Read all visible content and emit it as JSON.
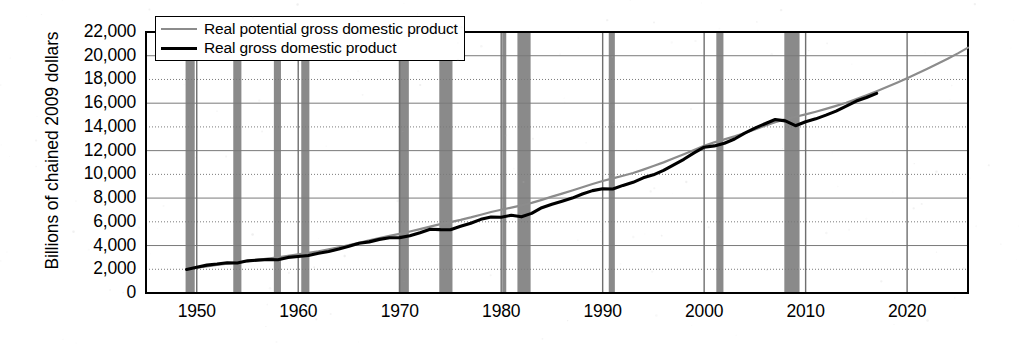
{
  "chart_data": {
    "type": "line",
    "title": "",
    "subtitle": "",
    "xlabel": "",
    "ylabel": "Billions of chained 2009 dollars",
    "xlim": [
      1945,
      2026
    ],
    "ylim": [
      0,
      22000
    ],
    "grid": true,
    "legend_position": "top-left-inside",
    "yticks": [
      "0",
      "2,000",
      "4,000",
      "6,000",
      "8,000",
      "10,000",
      "12,000",
      "14,000",
      "16,000",
      "18,000",
      "20,000",
      "22,000"
    ],
    "ytick_values": [
      0,
      2000,
      4000,
      6000,
      8000,
      10000,
      12000,
      14000,
      16000,
      18000,
      20000,
      22000
    ],
    "xticks": [
      "1950",
      "1960",
      "1970",
      "1980",
      "1990",
      "2000",
      "2010",
      "2020"
    ],
    "xtick_values": [
      1950,
      1960,
      1970,
      1980,
      1990,
      2000,
      2010,
      2020
    ],
    "colors": {
      "potential": "#8c8c8c",
      "actual": "#000000",
      "recession_band": "#8a8a8a",
      "gridline": "#7a7a7a",
      "axis": "#000000",
      "background": "#ffffff"
    },
    "series": [
      {
        "name": "Real potential gross domestic product",
        "color": "#8c8c8c",
        "style": "thin-gray",
        "x": [
          1949,
          1950,
          1951,
          1952,
          1953,
          1954,
          1955,
          1956,
          1957,
          1958,
          1959,
          1960,
          1961,
          1962,
          1963,
          1964,
          1965,
          1966,
          1967,
          1968,
          1969,
          1970,
          1971,
          1972,
          1973,
          1974,
          1975,
          1976,
          1977,
          1978,
          1979,
          1980,
          1981,
          1982,
          1983,
          1984,
          1985,
          1986,
          1987,
          1988,
          1989,
          1990,
          1991,
          1992,
          1993,
          1994,
          1995,
          1996,
          1997,
          1998,
          1999,
          2000,
          2001,
          2002,
          2003,
          2004,
          2005,
          2006,
          2007,
          2008,
          2009,
          2010,
          2011,
          2012,
          2013,
          2014,
          2015,
          2016,
          2017,
          2018,
          2019,
          2020,
          2021,
          2022,
          2023,
          2024,
          2025,
          2026
        ],
        "values": [
          2010,
          2130,
          2250,
          2360,
          2470,
          2570,
          2680,
          2790,
          2900,
          3010,
          3130,
          3250,
          3380,
          3520,
          3680,
          3850,
          4040,
          4240,
          4430,
          4620,
          4810,
          4990,
          5180,
          5380,
          5600,
          5800,
          5980,
          6160,
          6370,
          6600,
          6830,
          7020,
          7200,
          7390,
          7600,
          7850,
          8120,
          8380,
          8640,
          8920,
          9190,
          9440,
          9660,
          9880,
          10120,
          10400,
          10700,
          11010,
          11350,
          11700,
          12060,
          12400,
          12700,
          12950,
          13200,
          13480,
          13790,
          14100,
          14400,
          14650,
          14860,
          15060,
          15280,
          15520,
          15770,
          16040,
          16340,
          16660,
          17000,
          17360,
          17730,
          18110,
          18500,
          18900,
          19320,
          19750,
          20200,
          20680
        ]
      },
      {
        "name": "Real gross domestic product",
        "color": "#000000",
        "style": "thick-black",
        "x": [
          1949,
          1950,
          1951,
          1952,
          1953,
          1954,
          1955,
          1956,
          1957,
          1958,
          1959,
          1960,
          1961,
          1962,
          1963,
          1964,
          1965,
          1966,
          1967,
          1968,
          1969,
          1970,
          1971,
          1972,
          1973,
          1974,
          1975,
          1976,
          1977,
          1978,
          1979,
          1980,
          1981,
          1982,
          1983,
          1984,
          1985,
          1986,
          1987,
          1988,
          1989,
          1990,
          1991,
          1992,
          1993,
          1994,
          1995,
          1996,
          1997,
          1998,
          1999,
          2000,
          2001,
          2002,
          2003,
          2004,
          2005,
          2006,
          2007,
          2008,
          2009,
          2010,
          2011,
          2012,
          2013,
          2014,
          2015,
          2016,
          2017
        ],
        "values": [
          1990,
          2180,
          2350,
          2440,
          2550,
          2530,
          2710,
          2770,
          2830,
          2800,
          3000,
          3080,
          3160,
          3350,
          3500,
          3700,
          3940,
          4200,
          4310,
          4520,
          4660,
          4670,
          4820,
          5080,
          5370,
          5340,
          5330,
          5620,
          5880,
          6210,
          6410,
          6390,
          6550,
          6420,
          6710,
          7190,
          7480,
          7740,
          8000,
          8340,
          8630,
          8790,
          8770,
          9070,
          9330,
          9710,
          9960,
          10340,
          10800,
          11270,
          11810,
          12290,
          12400,
          12620,
          12980,
          13470,
          13900,
          14270,
          14620,
          14510,
          14100,
          14440,
          14680,
          14990,
          15330,
          15750,
          16180,
          16480,
          16830
        ]
      }
    ],
    "recession_bands": [
      {
        "start": 1948.9,
        "end": 1949.8
      },
      {
        "start": 1953.6,
        "end": 1954.4
      },
      {
        "start": 1957.6,
        "end": 1958.3
      },
      {
        "start": 1960.3,
        "end": 1961.1
      },
      {
        "start": 1969.9,
        "end": 1970.9
      },
      {
        "start": 1973.9,
        "end": 1975.2
      },
      {
        "start": 1980.1,
        "end": 1980.5
      },
      {
        "start": 1981.6,
        "end": 1982.9
      },
      {
        "start": 1990.6,
        "end": 1991.2
      },
      {
        "start": 2001.2,
        "end": 2001.9
      },
      {
        "start": 2007.9,
        "end": 2009.4
      }
    ]
  },
  "legend": {
    "entries": [
      {
        "label": "Real potential gross domestic product",
        "swatch": "thin-gray-line"
      },
      {
        "label": "Real gross domestic product",
        "swatch": "thick-black-line"
      }
    ]
  }
}
